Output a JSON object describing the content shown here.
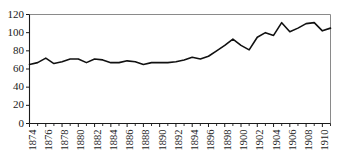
{
  "chart_data": {
    "type": "line",
    "title": "",
    "subtitle": "",
    "xlabel": "",
    "ylabel": "",
    "xlim": [
      1874,
      1911
    ],
    "ylim": [
      0,
      120
    ],
    "grid": false,
    "legend": null,
    "y_ticks": [
      0,
      20,
      40,
      60,
      80,
      100,
      120
    ],
    "y_tick_labels": [
      "0",
      "20",
      "40",
      "60",
      "80",
      "100",
      "120"
    ],
    "x_tick_labels": [
      "1874",
      "1876",
      "1878",
      "1880",
      "1882",
      "1884",
      "1886",
      "1888",
      "1890",
      "1892",
      "1894",
      "1896",
      "1898",
      "1900",
      "1902",
      "1904",
      "1906",
      "1908",
      "1910"
    ],
    "x_minor_tick_years": [
      1875,
      1877,
      1879,
      1881,
      1883,
      1885,
      1887,
      1889,
      1891,
      1893,
      1895,
      1897,
      1899,
      1901,
      1903,
      1905,
      1907,
      1909,
      1911
    ],
    "series": [
      {
        "name": "series-1",
        "color": "#111111",
        "x": [
          1874,
          1875,
          1876,
          1877,
          1878,
          1879,
          1880,
          1881,
          1882,
          1883,
          1884,
          1885,
          1886,
          1887,
          1888,
          1889,
          1890,
          1891,
          1892,
          1893,
          1894,
          1895,
          1896,
          1897,
          1898,
          1899,
          1900,
          1901,
          1902,
          1903,
          1904,
          1905,
          1906,
          1907,
          1908,
          1909,
          1910,
          1911
        ],
        "values": [
          65,
          67,
          72,
          66,
          68,
          71,
          71,
          67,
          71,
          70,
          67,
          67,
          69,
          68,
          65,
          67,
          67,
          67,
          68,
          70,
          73,
          71,
          74,
          80,
          86,
          93,
          86,
          81,
          95,
          100,
          97,
          111,
          101,
          105,
          110,
          111,
          102,
          105
        ]
      }
    ]
  },
  "axes": {
    "y_axis_name": "y-axis",
    "x_axis_name": "x-axis"
  }
}
